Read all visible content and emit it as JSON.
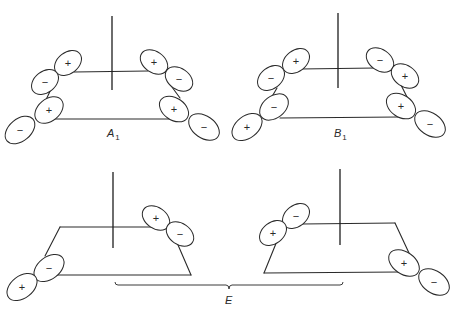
{
  "figure": {
    "width": 464,
    "height": 316,
    "stroke_color": "#2a2a2a",
    "panels": [
      {
        "name": "A1",
        "label": {
          "text": "A",
          "sub": "1",
          "x": 107,
          "y": 137
        },
        "axis": {
          "x": 112,
          "y1": 16,
          "y2": 90
        },
        "edges": [
          [
            74,
            72,
            148,
            71
          ],
          [
            53,
            119,
            172,
            119
          ],
          [
            52,
            87,
            45,
            102
          ],
          [
            169,
            83,
            180,
            98
          ]
        ],
        "lobes": [
          {
            "sign": "+",
            "cx": 68,
            "cy": 63,
            "rx": 15,
            "ry": 10.5,
            "rot": -38
          },
          {
            "sign": "−",
            "cx": 45,
            "cy": 82,
            "rx": 15,
            "ry": 10.5,
            "rot": -38
          },
          {
            "sign": "+",
            "cx": 49,
            "cy": 110,
            "rx": 16,
            "ry": 11,
            "rot": -40
          },
          {
            "sign": "−",
            "cx": 20,
            "cy": 130,
            "rx": 17,
            "ry": 11,
            "rot": -40
          },
          {
            "sign": "+",
            "cx": 154,
            "cy": 62,
            "rx": 15,
            "ry": 10.5,
            "rot": 35
          },
          {
            "sign": "−",
            "cx": 179,
            "cy": 79,
            "rx": 15,
            "ry": 10.5,
            "rot": 35
          },
          {
            "sign": "+",
            "cx": 174,
            "cy": 109,
            "rx": 16,
            "ry": 11,
            "rot": 35
          },
          {
            "sign": "−",
            "cx": 204,
            "cy": 127,
            "rx": 17,
            "ry": 11,
            "rot": 35
          }
        ]
      },
      {
        "name": "B1",
        "label": {
          "text": "B",
          "sub": "1",
          "x": 334,
          "y": 137
        },
        "axis": {
          "x": 338,
          "y1": 13,
          "y2": 88
        },
        "edges": [
          [
            300,
            69,
            376,
            68
          ],
          [
            280,
            118,
            399,
            117
          ],
          [
            277,
            88,
            270,
            100
          ],
          [
            400,
            83,
            407,
            97
          ]
        ],
        "lobes": [
          {
            "sign": "+",
            "cx": 296,
            "cy": 61,
            "rx": 15,
            "ry": 10.5,
            "rot": -38
          },
          {
            "sign": "−",
            "cx": 271,
            "cy": 78,
            "rx": 15,
            "ry": 10.5,
            "rot": -38
          },
          {
            "sign": "−",
            "cx": 274,
            "cy": 107,
            "rx": 16,
            "ry": 11,
            "rot": -38
          },
          {
            "sign": "+",
            "cx": 247,
            "cy": 127,
            "rx": 17,
            "ry": 11,
            "rot": -38
          },
          {
            "sign": "−",
            "cx": 380,
            "cy": 60,
            "rx": 15,
            "ry": 10.5,
            "rot": 35
          },
          {
            "sign": "+",
            "cx": 405,
            "cy": 76,
            "rx": 15,
            "ry": 10.5,
            "rot": 35
          },
          {
            "sign": "+",
            "cx": 401,
            "cy": 106,
            "rx": 16,
            "ry": 11,
            "rot": 35
          },
          {
            "sign": "−",
            "cx": 430,
            "cy": 124,
            "rx": 17,
            "ry": 11,
            "rot": 35
          }
        ]
      },
      {
        "name": "E-left",
        "label": null,
        "axis": {
          "x": 113,
          "y1": 172,
          "y2": 248
        },
        "edges": [
          [
            60,
            227,
            152,
            227
          ],
          [
            60,
            227,
            45,
            256
          ],
          [
            55,
            275,
            191,
            275
          ],
          [
            175,
            238,
            191,
            275
          ]
        ],
        "lobes": [
          {
            "sign": "−",
            "cx": 49,
            "cy": 268,
            "rx": 17,
            "ry": 11,
            "rot": -38
          },
          {
            "sign": "+",
            "cx": 22,
            "cy": 287,
            "rx": 17,
            "ry": 11,
            "rot": -38
          },
          {
            "sign": "+",
            "cx": 156,
            "cy": 218,
            "rx": 15,
            "ry": 10.5,
            "rot": 35
          },
          {
            "sign": "−",
            "cx": 180,
            "cy": 234,
            "rx": 15,
            "ry": 10.5,
            "rot": 35
          }
        ]
      },
      {
        "name": "E-right",
        "label": null,
        "axis": {
          "x": 340,
          "y1": 169,
          "y2": 245
        },
        "edges": [
          [
            302,
            224,
            395,
            223
          ],
          [
            395,
            223,
            409,
            253
          ],
          [
            277,
            241,
            264,
            273
          ],
          [
            264,
            273,
            399,
            272
          ]
        ],
        "lobes": [
          {
            "sign": "−",
            "cx": 296,
            "cy": 216,
            "rx": 15,
            "ry": 10.5,
            "rot": -38
          },
          {
            "sign": "+",
            "cx": 273,
            "cy": 233,
            "rx": 15,
            "ry": 10.5,
            "rot": -38
          },
          {
            "sign": "+",
            "cx": 404,
            "cy": 263,
            "rx": 17,
            "ry": 11,
            "rot": 35
          },
          {
            "sign": "−",
            "cx": 434,
            "cy": 282,
            "rx": 17,
            "ry": 11,
            "rot": 35
          }
        ]
      }
    ],
    "bracket": {
      "x1": 115,
      "x2": 343,
      "y": 285,
      "mid_x": 229,
      "tick_depth": 4,
      "curl": 3,
      "label": {
        "text": "E",
        "sub": "",
        "x": 225,
        "y": 304
      }
    }
  }
}
